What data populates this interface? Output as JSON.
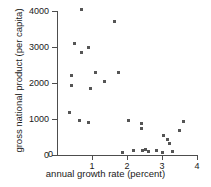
{
  "chart_data": {
    "type": "scatter",
    "title": "",
    "xlabel": "annual growth rate (percent)",
    "ylabel": "gross national product (per capita)",
    "xlim": [
      0,
      4
    ],
    "ylim": [
      0,
      4000
    ],
    "xticks": [
      0,
      1,
      2,
      3,
      4
    ],
    "xtick_labels": [
      "0",
      "1",
      "2",
      "3",
      "4"
    ],
    "yticks": [
      0,
      1000,
      2000,
      3000,
      4000
    ],
    "ytick_labels": [
      "0",
      "1000",
      "2000",
      "3000",
      "4000"
    ],
    "grid": false,
    "legend": false,
    "marker_color": "#555555",
    "axis_color": "#4d4d4d",
    "series": [
      {
        "name": "countries",
        "points": [
          [
            0.69,
            4030
          ],
          [
            1.63,
            3700
          ],
          [
            0.51,
            3110
          ],
          [
            0.89,
            3000
          ],
          [
            0.71,
            2860
          ],
          [
            1.11,
            2280
          ],
          [
            1.77,
            2280
          ],
          [
            0.4,
            2220
          ],
          [
            1.37,
            2030
          ],
          [
            0.4,
            1920
          ],
          [
            0.97,
            1860
          ],
          [
            0.37,
            1190
          ],
          [
            0.63,
            970
          ],
          [
            0.91,
            890
          ],
          [
            2.03,
            950
          ],
          [
            2.4,
            870
          ],
          [
            2.4,
            750
          ],
          [
            3.6,
            920
          ],
          [
            3.51,
            670
          ],
          [
            3.03,
            530
          ],
          [
            3.17,
            420
          ],
          [
            3.2,
            330
          ],
          [
            1.88,
            60
          ],
          [
            2.18,
            120
          ],
          [
            2.43,
            120
          ],
          [
            2.54,
            140
          ],
          [
            2.6,
            100
          ],
          [
            2.83,
            130
          ],
          [
            3.0,
            60
          ],
          [
            3.31,
            110
          ]
        ]
      }
    ]
  },
  "axes": {
    "x_title": "annual growth rate (percent)",
    "y_title": "gross national product (per capita)"
  }
}
